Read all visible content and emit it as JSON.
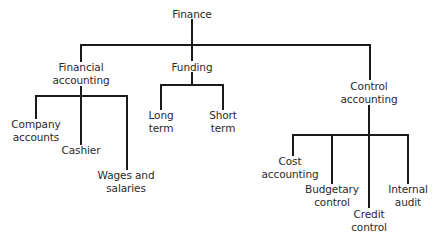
{
  "diagram": {
    "type": "org-chart",
    "root": {
      "lines": [
        "Finance"
      ],
      "children": [
        {
          "lines": [
            "Financial",
            "accounting"
          ],
          "children": [
            {
              "lines": [
                "Company",
                "accounts"
              ]
            },
            {
              "lines": [
                "Cashier"
              ]
            },
            {
              "lines": [
                "Wages and",
                "salaries"
              ]
            }
          ]
        },
        {
          "lines": [
            "Funding"
          ],
          "children": [
            {
              "lines": [
                "Long",
                "term"
              ]
            },
            {
              "lines": [
                "Short",
                "term"
              ]
            }
          ]
        },
        {
          "lines": [
            "Control",
            "accounting"
          ],
          "children": [
            {
              "lines": [
                "Cost",
                "accounting"
              ]
            },
            {
              "lines": [
                "Budgetary",
                "control"
              ]
            },
            {
              "lines": [
                "Credit",
                "control"
              ]
            },
            {
              "lines": [
                "Internal",
                "audit"
              ]
            }
          ]
        }
      ]
    },
    "colors": {
      "line": "#1a1a1a",
      "text": "#2a2a2a",
      "background": "#ffffff"
    }
  }
}
